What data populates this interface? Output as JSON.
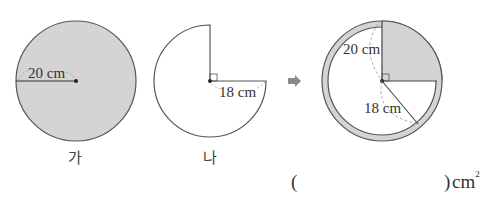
{
  "figures": {
    "ga": {
      "label": "가",
      "radius_label": "20 cm",
      "radius_cm": 20,
      "fill": "#d4d4d4"
    },
    "na": {
      "label": "나",
      "radius_label": "18 cm",
      "radius_cm": 18,
      "removed_quadrant": "upper-right",
      "fill": "#ffffff"
    },
    "arrow": {
      "glyph": "➡",
      "color": "#8a8a8a"
    },
    "combined": {
      "outer_radius_label": "20 cm",
      "inner_radius_label": "18 cm",
      "shaded_color": "#d4d4d4"
    }
  },
  "answer": {
    "open_paren": "(",
    "close_paren": ")",
    "unit": "cm",
    "unit_exp": "2"
  }
}
